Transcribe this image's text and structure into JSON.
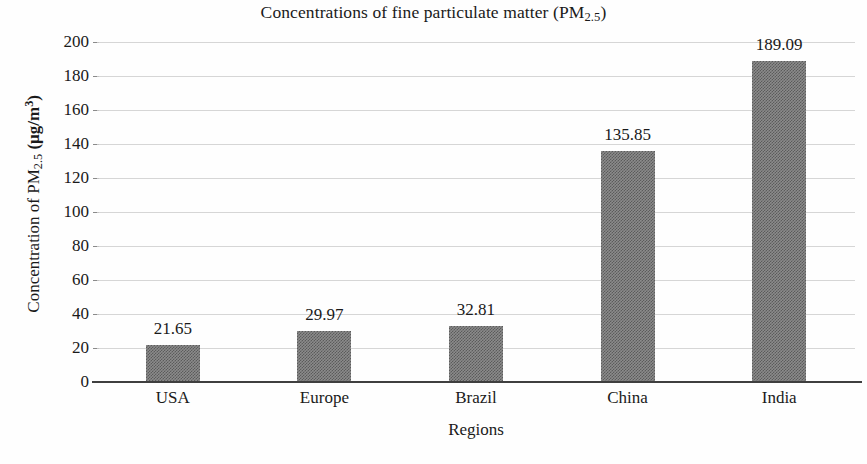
{
  "chart_data": {
    "type": "bar",
    "title": "Concentrations of fine particulate matter (PM2.5)",
    "title_parts": {
      "before": "Concentrations of fine particulate matter (PM",
      "subscript": "2.5",
      "after": ")"
    },
    "xlabel": "Regions",
    "ylabel": "Concentration of PM2.5 (µg/m3)",
    "ylabel_parts": {
      "before": "Concentration of PM",
      "subscript": "2.5",
      "unit_open": " (µg/m",
      "unit_superscript": "3",
      "unit_close": ")"
    },
    "categories": [
      "USA",
      "Europe",
      "Brazil",
      "China",
      "India"
    ],
    "values": [
      21.65,
      29.97,
      32.81,
      135.85,
      189.09
    ],
    "value_labels": [
      "21.65",
      "29.97",
      "32.81",
      "135.85",
      "189.09"
    ],
    "ylim": [
      0,
      200
    ],
    "ytick_step": 20,
    "ytick_labels": [
      "200",
      "180",
      "160",
      "140",
      "120",
      "100",
      "80",
      "60",
      "40",
      "20",
      "0"
    ],
    "grid": true,
    "legend": null,
    "bar_color": "#8b8b8b",
    "gridline_color": "#cfcfcf",
    "axis_color": "#3f3f3f",
    "text_color": "#1a1a1a"
  }
}
